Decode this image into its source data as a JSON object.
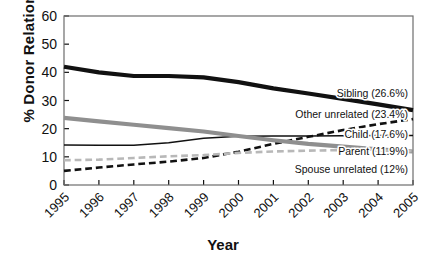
{
  "chart_data": {
    "type": "line",
    "title": "",
    "xlabel": "Year",
    "ylabel": "% Donor Relation",
    "categories": [
      1995,
      1996,
      1997,
      1998,
      1999,
      2000,
      2001,
      2002,
      2003,
      2004,
      2005
    ],
    "xlim": [
      1995,
      2005
    ],
    "ylim": [
      0,
      60
    ],
    "yticks": [
      0,
      10,
      20,
      30,
      40,
      50,
      60
    ],
    "xticks": [
      "1995",
      "1996",
      "1997",
      "1998",
      "1999",
      "2000",
      "2001",
      "2002",
      "2003",
      "2004",
      "2005"
    ],
    "grid": false,
    "legend_position": "right-inline-labels",
    "series": [
      {
        "name": "Sibling",
        "label": "Sibling (26.6%)",
        "final_value": 26.6,
        "color": "#111111",
        "style": "solid",
        "width": "thick",
        "values": [
          42.0,
          40.0,
          38.7,
          38.7,
          38.2,
          36.5,
          34.3,
          32.5,
          30.6,
          28.6,
          26.6
        ]
      },
      {
        "name": "Other unrelated",
        "label": "Other unrelated (23.4%)",
        "final_value": 23.4,
        "color": "#111111",
        "style": "dashed",
        "width": "medium",
        "values": [
          5.0,
          6.2,
          7.3,
          8.3,
          9.6,
          11.8,
          14.6,
          17.1,
          19.5,
          21.6,
          23.4
        ]
      },
      {
        "name": "Child",
        "label": "Child (17.6%)",
        "final_value": 17.6,
        "color": "#111111",
        "style": "solid",
        "width": "thin",
        "values": [
          14.2,
          14.1,
          14.1,
          15.0,
          16.6,
          17.3,
          17.4,
          17.4,
          17.5,
          17.6,
          17.6
        ]
      },
      {
        "name": "Parent",
        "label": "Parent (11.9%)",
        "final_value": 11.9,
        "color": "#8f8f8f",
        "style": "solid",
        "width": "thick",
        "values": [
          23.8,
          22.6,
          21.4,
          20.2,
          19.0,
          17.4,
          15.9,
          14.6,
          13.6,
          12.7,
          11.9
        ]
      },
      {
        "name": "Spouse unrelated",
        "label": "Spouse unrelated (12%)",
        "final_value": 12.0,
        "color": "#b8b8b8",
        "style": "dashed",
        "width": "medium",
        "values": [
          8.8,
          9.0,
          9.6,
          10.2,
          10.6,
          11.4,
          11.9,
          12.2,
          12.4,
          12.3,
          12.0
        ]
      }
    ]
  },
  "axes": {
    "y_title": "% Donor Relation",
    "x_title": "Year"
  }
}
